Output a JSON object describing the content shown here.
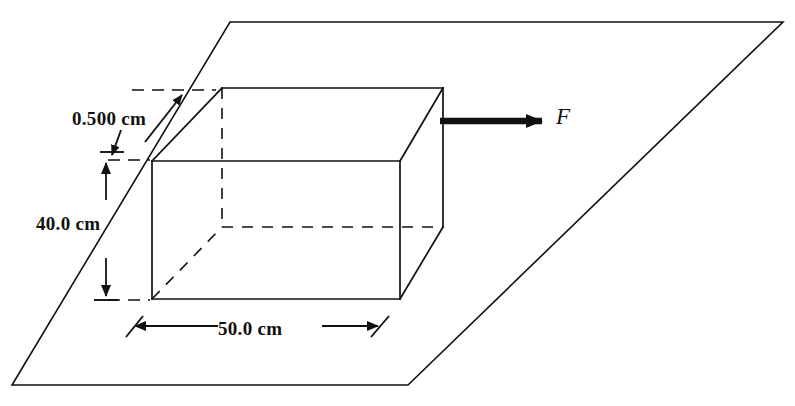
{
  "figure": {
    "background_color": "#ffffff",
    "line_color": "#111111",
    "dimensions": {
      "thickness": "0.500 cm",
      "height": "40.0 cm",
      "width": "50.0 cm"
    },
    "force": {
      "label": "F"
    },
    "geometry": {
      "plane": {
        "shape": "parallelogram",
        "points": "230,22 783,22 408,385 12,385"
      },
      "box": {
        "front_face": "152,161 400,161 400,299 152,299",
        "top_back_edge": "222,88 443,88",
        "top_left_slant": "152,161 222,88",
        "top_right_slant": "400,161 443,88",
        "back_right_vertical": "443,88 443,227",
        "bottom_right_slant": "400,299 443,227",
        "hidden_back_left_vertical": "222,88 222,227",
        "hidden_back_bottom_edge": "222,227 443,227",
        "hidden_bottom_left_slant": "152,299 222,227"
      }
    }
  }
}
